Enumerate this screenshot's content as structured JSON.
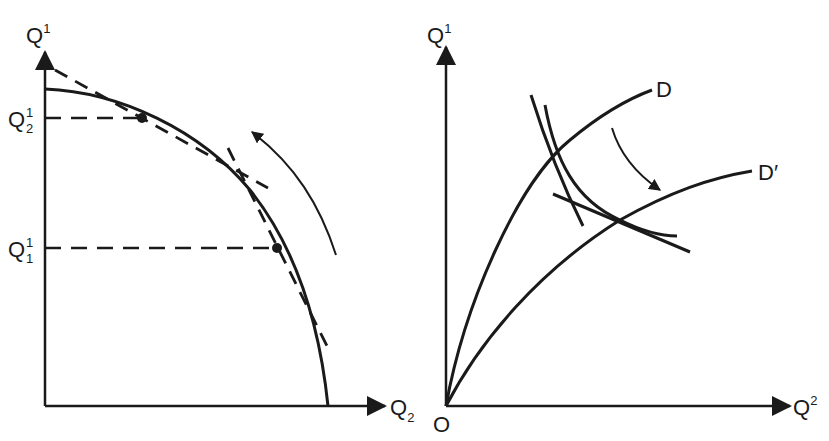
{
  "left_panel": {
    "y_axis_label": "Q",
    "y_axis_sup": "1",
    "x_axis_label": "Q",
    "x_axis_sub": "2",
    "tick_upper_label": "Q",
    "tick_upper_sup": "1",
    "tick_upper_sub": "2",
    "tick_lower_label": "Q",
    "tick_lower_sup": "1",
    "tick_lower_sub": "1",
    "description": "Concave production possibility frontier with tangent dashed lines at two points and a counter-clockwise arrow"
  },
  "right_panel": {
    "y_axis_label": "Q",
    "y_axis_sup": "1",
    "x_axis_label": "Q",
    "x_axis_sup": "2",
    "origin_label": "O",
    "curve_D_label": "D",
    "curve_D_prime_label": "D′",
    "description": "Two curves D and D' from origin, with intersecting indifference-like curves and a clockwise arrow from D to D'"
  },
  "colors": {
    "ink": "#1a1a1a",
    "background": "#ffffff"
  }
}
